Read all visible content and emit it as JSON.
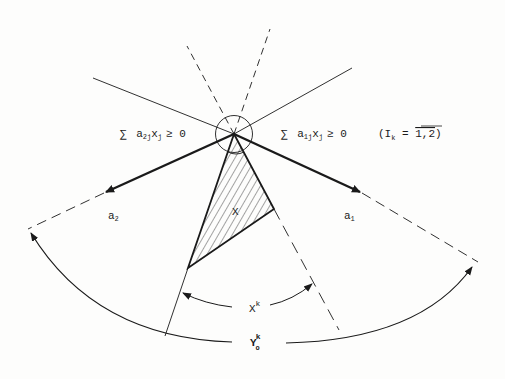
{
  "diagram": {
    "type": "cone-geometry",
    "colors": {
      "ink": "#1a1a1a",
      "background": "#fdfdfc"
    },
    "constraint_left": {
      "sum": "∑",
      "a": "a",
      "a_sub": "2j",
      "x": "x",
      "x_sub": "j",
      "rel": "≥ 0"
    },
    "constraint_right": {
      "sum": "∑",
      "a": "a",
      "a_sub": "1j",
      "x": "x",
      "x_sub": "j",
      "rel": "≥ 0",
      "index_note": "(I",
      "index_sub": "k",
      "index_eq": " = ",
      "index_set": "1,2",
      "index_close": ")"
    },
    "vectors": [
      {
        "name": "a",
        "sub": "2"
      },
      {
        "name": "a",
        "sub": "1"
      }
    ],
    "region_label": "X",
    "inner_arc_label": {
      "base": "X",
      "sup": "k"
    },
    "outer_arc_label": {
      "base": "Y",
      "sub": "o",
      "sup": "k"
    }
  }
}
